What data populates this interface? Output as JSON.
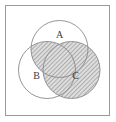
{
  "figure": {
    "type": "venn-diagram",
    "title": "",
    "sets": [
      {
        "id": "A",
        "label": "A",
        "cx": 59.5,
        "cy": 49.0,
        "r": 28.5,
        "label_x": 59.5,
        "label_y": 36.0,
        "shaded": false
      },
      {
        "id": "B",
        "label": "B",
        "cx": 47.0,
        "cy": 70.0,
        "r": 28.5,
        "label_x": 36.5,
        "label_y": 77.0,
        "shaded": false
      },
      {
        "id": "C",
        "label": "C",
        "cx": 71.5,
        "cy": 70.0,
        "r": 28.5,
        "label_x": 75.5,
        "label_y": 77.0,
        "shaded": true
      }
    ],
    "frame": {
      "x": 5.5,
      "y": 5.5,
      "width": 104,
      "height": 110
    },
    "shading": {
      "description": "C union (A intersect B)",
      "pattern": "diagonal-hatch-45",
      "hatch_spacing": 3,
      "hatch_color": "#7a7a7a",
      "fill_color": "#d9d9d9"
    },
    "colors": {
      "stroke": "#8a8a8a",
      "frame_stroke": "#9a9a9a",
      "background": "#ffffff",
      "label": "#3a3a3a"
    }
  }
}
